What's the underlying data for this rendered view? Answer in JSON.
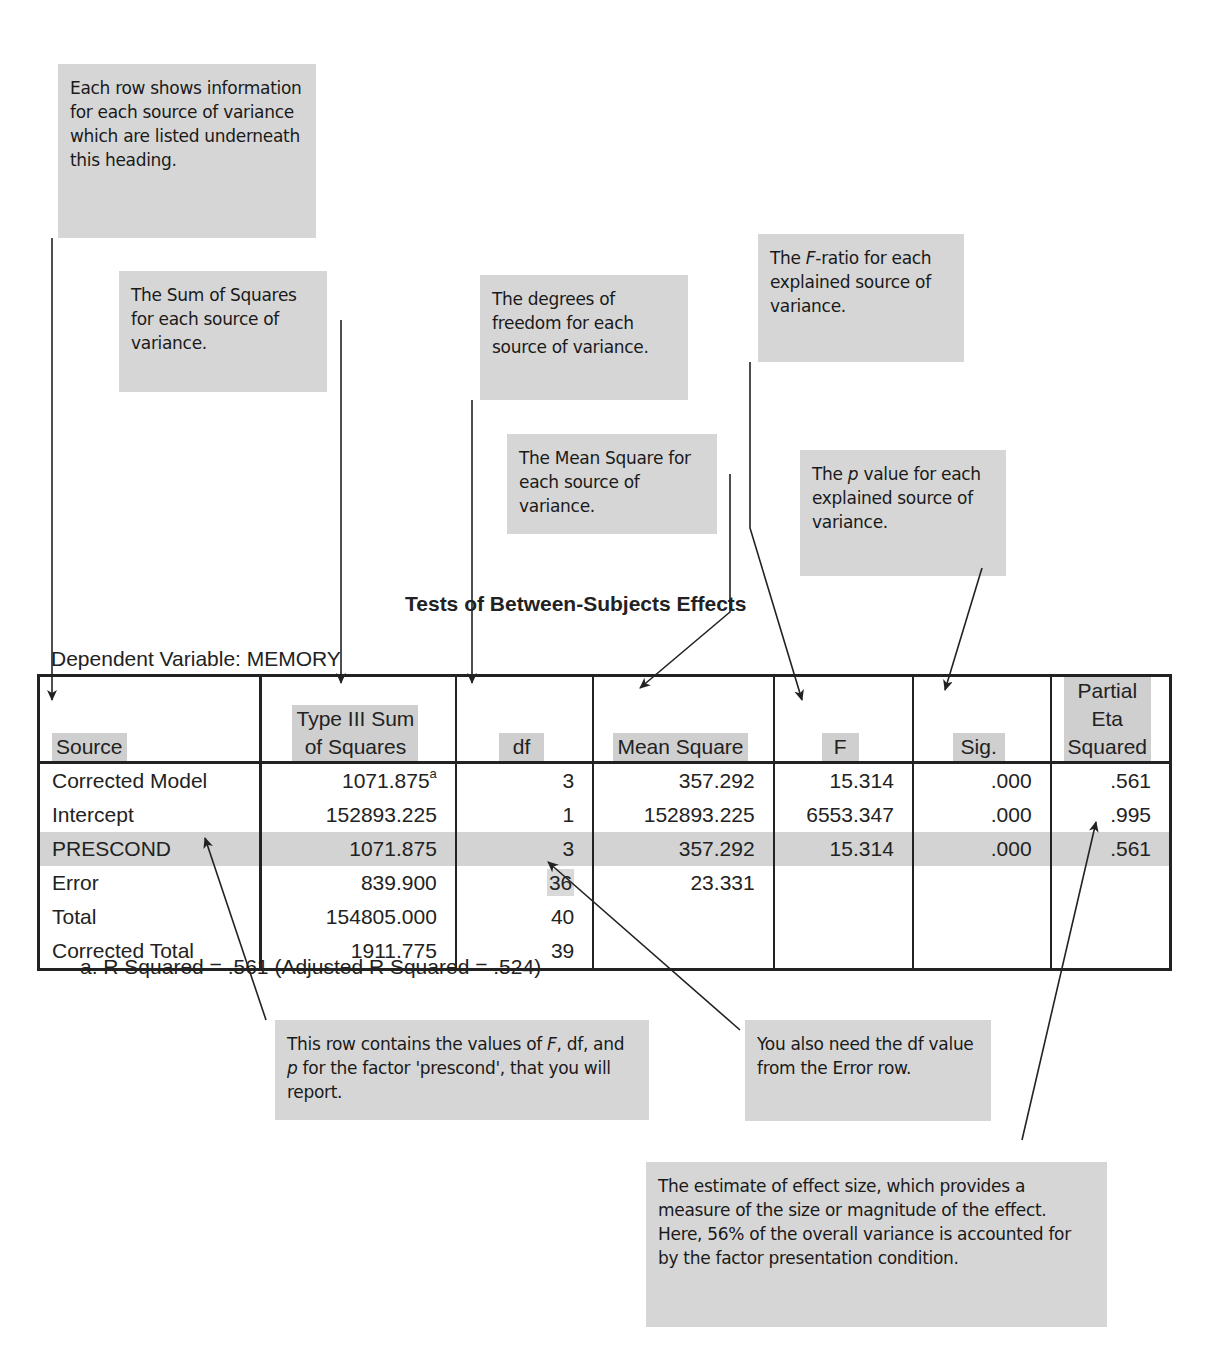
{
  "annotations": {
    "source_note": "Each row shows information for each source of variance which are listed underneath this heading.",
    "ss_note": "The Sum of Squares for each source of variance.",
    "df_note": "The degrees of freedom for each source of variance.",
    "ms_note": "The Mean Square for each source of variance.",
    "f_note_pre": "The ",
    "f_note_italic": "F",
    "f_note_post": "-ratio for each explained source of variance.",
    "p_note_pre": "The ",
    "p_note_italic": "p",
    "p_note_post": " value for each explained source of variance.",
    "row_note_1": "This row contains the values of ",
    "row_note_F": "F",
    "row_note_2": ", df, and ",
    "row_note_p": "p",
    "row_note_3": " for the factor 'prescond', that you will report.",
    "error_df_note": "You also need the df value from the Error row.",
    "effect_note": "The estimate of effect size, which provides a measure of the size or magnitude of the effect. Here, 56% of the overall variance is accounted for by the factor presentation condition."
  },
  "table": {
    "title": "Tests of Between-Subjects Effects",
    "dependent_variable": "Dependent Variable: MEMORY",
    "headers": {
      "source": "Source",
      "ss_line1": "Type III Sum",
      "ss_line2": "of Squares",
      "df": "df",
      "ms": "Mean Square",
      "f": "F",
      "sig": "Sig.",
      "eta_line1": "Partial Eta",
      "eta_line2": "Squared"
    },
    "rows": [
      {
        "source": "Corrected Model",
        "ss": "1071.875",
        "ss_sup": "a",
        "df": "3",
        "ms": "357.292",
        "f": "15.314",
        "sig": ".000",
        "eta": ".561"
      },
      {
        "source": "Intercept",
        "ss": "152893.225",
        "df": "1",
        "ms": "152893.225",
        "f": "6553.347",
        "sig": ".000",
        "eta": ".995"
      },
      {
        "source": "PRESCOND",
        "ss": "1071.875",
        "df": "3",
        "ms": "357.292",
        "f": "15.314",
        "sig": ".000",
        "eta": ".561"
      },
      {
        "source": "Error",
        "ss": "839.900",
        "df": "36",
        "ms": "23.331",
        "f": "",
        "sig": "",
        "eta": ""
      },
      {
        "source": "Total",
        "ss": "154805.000",
        "df": "40",
        "ms": "",
        "f": "",
        "sig": "",
        "eta": ""
      },
      {
        "source": "Corrected Total",
        "ss": "1911.775",
        "df": "39",
        "ms": "",
        "f": "",
        "sig": "",
        "eta": ""
      }
    ],
    "footnote": "a. R Squared = .561 (Adjusted R Squared = .524)"
  },
  "colors": {
    "note_bg": "#d6d6d6",
    "highlight_row": "#d3d3d3",
    "text": "#222222"
  }
}
